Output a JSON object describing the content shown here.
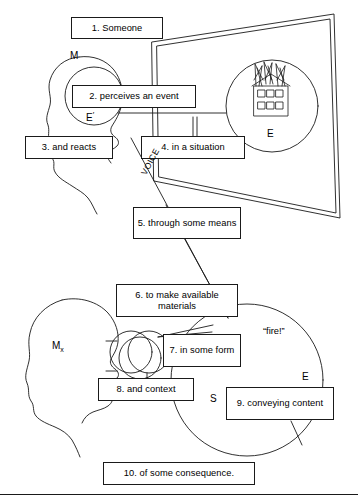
{
  "figure": {
    "background": "#ffffff",
    "ink": "#1a1a1a"
  },
  "boxes": [
    {
      "id": "step1",
      "label": "1. Someone"
    },
    {
      "id": "step2",
      "label": "2. perceives an event"
    },
    {
      "id": "step3",
      "label": "3. and reacts"
    },
    {
      "id": "step4",
      "label": "4. in a situation"
    },
    {
      "id": "step5",
      "label": "5. through some means"
    },
    {
      "id": "step6",
      "label": "6. to make available materials"
    },
    {
      "id": "step7",
      "label": "7. in some form"
    },
    {
      "id": "step8",
      "label": "8. and context"
    },
    {
      "id": "step9",
      "label": "9. conveying content"
    },
    {
      "id": "step10",
      "label": "10. of some consequence."
    }
  ],
  "labels": {
    "mind_upper": "M",
    "event_percept": "E",
    "event_percept_prime": "′",
    "event_world": "E",
    "mind_lower_base": "M",
    "mind_lower_sub": "x",
    "utterance": "“fire!”",
    "event_lower": "E",
    "situation_lower": "S",
    "channel": "VOICE"
  },
  "icons": {
    "burning_building": "burning-building-icon",
    "head_profile_upper": "head-profile-icon",
    "head_profile_lower": "head-profile-icon",
    "sound_waves": "sound-waves-icon"
  }
}
